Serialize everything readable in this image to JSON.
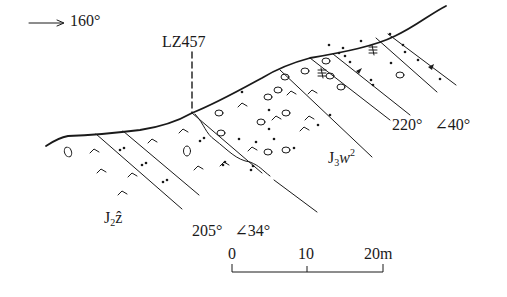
{
  "diagram": {
    "type": "geological-cross-section",
    "direction": {
      "arrow": "→",
      "label": "160°"
    },
    "sample": {
      "label": "LZ457"
    },
    "attitudes": [
      {
        "id": "upper-right",
        "strike": "220°",
        "dip": "∠40°"
      },
      {
        "id": "lower",
        "strike": "205°",
        "dip": "∠34°"
      }
    ],
    "formations": [
      {
        "id": "J2z",
        "base": "J",
        "sub": "2",
        "letter": "ẑ"
      },
      {
        "id": "J3w2",
        "base": "J",
        "sub": "3",
        "letter": "w",
        "sup": "2"
      }
    ],
    "scale_bar": {
      "ticks": [
        "0",
        "10",
        "20m"
      ]
    }
  },
  "colors": {
    "ink": "#1a1a1a",
    "background": "#ffffff"
  }
}
